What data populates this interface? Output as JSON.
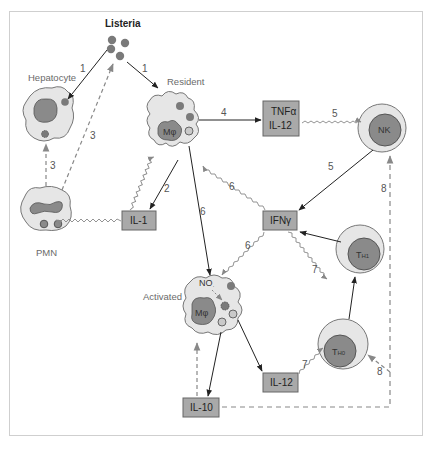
{
  "title": "Listeria",
  "cells": {
    "hepatocyte": "Hepatocyte",
    "resident": "Resident",
    "activated": "Activated",
    "pmn": "PMN",
    "macrophage": "Mφ",
    "no": "NO",
    "nk": "NK",
    "th1_main": "T",
    "th1_sub": "H1",
    "th0_main": "T",
    "th0_sub": "H0"
  },
  "cytokines": {
    "tnf_line1": "TNFα",
    "tnf_line2": "IL-12",
    "il1": "IL-1",
    "ifng": "IFNγ",
    "il12": "IL-12",
    "il10": "IL-10"
  },
  "steps": {
    "s1a": "1",
    "s1b": "1",
    "s2": "2",
    "s3a": "3",
    "s3b": "3",
    "s4": "4",
    "s5a": "5",
    "s5b": "5",
    "s6a": "6",
    "s6b": "6",
    "s6c": "6",
    "s7a": "7",
    "s7b": "7",
    "s8a": "8",
    "s8b": "8"
  },
  "colors": {
    "cell_fill": "#e6e6e6",
    "nucleus_fill": "#8a8a8a",
    "box_fill": "#a9a9a9",
    "bacteria": "#7a7a7a",
    "arrow_solid": "#222222",
    "arrow_signal": "#888888"
  }
}
